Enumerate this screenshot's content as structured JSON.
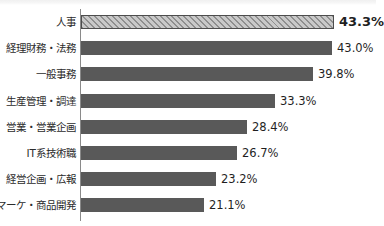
{
  "chart_data": {
    "type": "bar",
    "orientation": "horizontal",
    "title": "",
    "subtitle": "",
    "xlabel": "",
    "ylabel": "",
    "grid": false,
    "legend": null,
    "axis_range": [
      0,
      43.3
    ],
    "value_suffix": "%",
    "categories": [
      "人事",
      "経理財務・法務",
      "一般事務",
      "生産管理・調達",
      "営業・営業企画",
      "IT系技術職",
      "経営企画・広報",
      "マーケ・商品開発"
    ],
    "values": [
      43.3,
      43.0,
      39.8,
      33.3,
      28.4,
      26.7,
      23.2,
      21.1
    ],
    "value_labels": [
      "43.3%",
      "43.0%",
      "39.8%",
      "33.3%",
      "28.4%",
      "26.7%",
      "23.2%",
      "21.1%"
    ],
    "highlight_index": 0,
    "colors": {
      "bar": "#595959",
      "highlight_fill": "#a6a6a6",
      "highlight_hatch": "#8f8f8f",
      "highlight_border": "#4d4d4d",
      "axis": "#8a8a8a",
      "label_text": "#2b2b2b",
      "value_text": "#1f1f1f",
      "background": "#ffffff"
    }
  }
}
